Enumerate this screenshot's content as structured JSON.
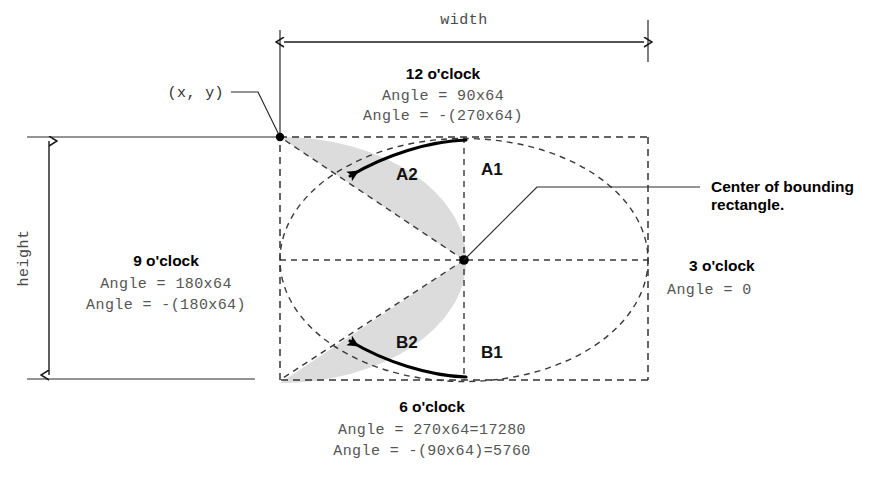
{
  "diagram": {
    "dimensions": {
      "width_label": "width",
      "height_label": "height"
    },
    "origin_label": "(x, y)",
    "center_note_line1": "Center of bounding",
    "center_note_line2": "rectangle.",
    "clock_positions": [
      {
        "id": "twelve",
        "title": "12 o'clock",
        "lines": [
          "Angle = 90x64",
          "Angle = -(270x64)"
        ]
      },
      {
        "id": "nine",
        "title": "9 o'clock",
        "lines": [
          "Angle = 180x64",
          "Angle = -(180x64)"
        ]
      },
      {
        "id": "three",
        "title": "3 o'clock",
        "lines": [
          "Angle = 0"
        ]
      },
      {
        "id": "six",
        "title": "6 o'clock",
        "lines": [
          "Angle = 270x64=17280",
          "Angle = -(90x64)=5760"
        ]
      }
    ],
    "arc_labels": [
      {
        "id": "a1",
        "text": "A1"
      },
      {
        "id": "a2",
        "text": "A2"
      },
      {
        "id": "b1",
        "text": "B1"
      },
      {
        "id": "b2",
        "text": "B2"
      }
    ],
    "colors": {
      "sector_fill": "#dcdcdc",
      "line": "#1a1a1a",
      "dashed": "#333333",
      "mono_text": "#555555",
      "bold_text": "#000000"
    }
  }
}
